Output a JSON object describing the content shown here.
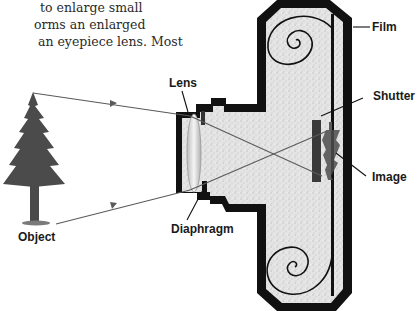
{
  "intro_text": {
    "lines": [
      "to enlarge small",
      "orms an enlarged",
      "an eyepiece lens. Most"
    ]
  },
  "diagram": {
    "labels": {
      "lens": "Lens",
      "film": "Film",
      "shutter": "Shutter",
      "image": "Image",
      "diaphragm": "Diaphragm",
      "object": "Object"
    },
    "colors": {
      "body_border": "#111111",
      "body_fill": "#dcdcdc",
      "ray": "#555555",
      "tree": "#4a4a4a"
    }
  }
}
